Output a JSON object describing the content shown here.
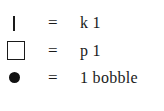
{
  "legend": {
    "items": [
      {
        "symbol": "vertical-bar",
        "equals": "=",
        "meaning": "k 1"
      },
      {
        "symbol": "empty-square",
        "equals": "=",
        "meaning": "p 1"
      },
      {
        "symbol": "filled-circle",
        "equals": "=",
        "meaning": "1 bobble"
      }
    ]
  }
}
